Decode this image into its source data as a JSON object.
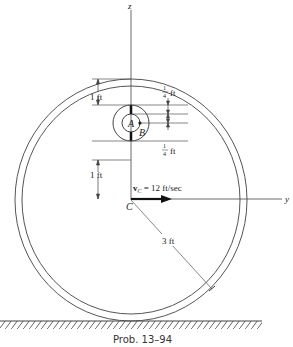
{
  "diagram": {
    "axes": {
      "z_label": "z",
      "y_label": "y",
      "origin_label": "C"
    },
    "points": {
      "A": "A",
      "B": "B"
    },
    "dimensions": {
      "top_gap": "1 ft",
      "bottom_gap": "1 ft",
      "quarter_top_num": "1",
      "quarter_top_den": "4",
      "quarter_top_unit": "ft",
      "quarter_bot_num": "1",
      "quarter_bot_den": "4",
      "quarter_bot_unit": "ft",
      "radius": "3 ft"
    },
    "velocity": {
      "symbol": "v",
      "subscript": "C",
      "value": " = 12 ft/sec"
    },
    "caption": "Prob. 13–94"
  }
}
